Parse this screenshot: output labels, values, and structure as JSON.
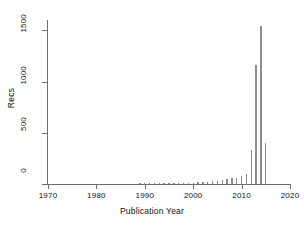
{
  "chart_data": {
    "type": "bar",
    "title": "",
    "xlabel": "Publication Year",
    "ylabel": "Recs",
    "xlim": [
      1970,
      2020
    ],
    "ylim": [
      0,
      1600
    ],
    "xticks": [
      1970,
      1980,
      1990,
      2000,
      2010,
      2020
    ],
    "yticks": [
      0,
      500,
      1000,
      1500
    ],
    "grid": false,
    "legend": null,
    "bar_color": "#8c8c8c",
    "axis_color": "#6d6d6d",
    "categories": [
      1989,
      1990,
      1991,
      1992,
      1993,
      1994,
      1995,
      1996,
      1997,
      1998,
      1999,
      2000,
      2001,
      2002,
      2003,
      2004,
      2005,
      2006,
      2007,
      2008,
      2009,
      2010,
      2011,
      2012,
      2013,
      2014,
      2015
    ],
    "values": [
      6,
      5,
      7,
      6,
      8,
      7,
      9,
      8,
      10,
      12,
      14,
      13,
      16,
      18,
      22,
      26,
      30,
      38,
      45,
      55,
      62,
      75,
      95,
      330,
      1160,
      1540,
      400
    ],
    "series": [
      {
        "name": "Recs",
        "values": [
          6,
          5,
          7,
          6,
          8,
          7,
          9,
          8,
          10,
          12,
          14,
          13,
          16,
          18,
          22,
          26,
          30,
          38,
          45,
          55,
          62,
          75,
          95,
          330,
          1160,
          1540,
          400
        ]
      }
    ],
    "annotations": []
  },
  "axes": {
    "y_tick_labels": [
      "0",
      "500",
      "1000",
      "1500"
    ],
    "x_tick_labels": [
      "1970",
      "1980",
      "1990",
      "2000",
      "2010",
      "2020"
    ],
    "y_axis_title": "Recs",
    "x_axis_title": "Publication Year"
  }
}
